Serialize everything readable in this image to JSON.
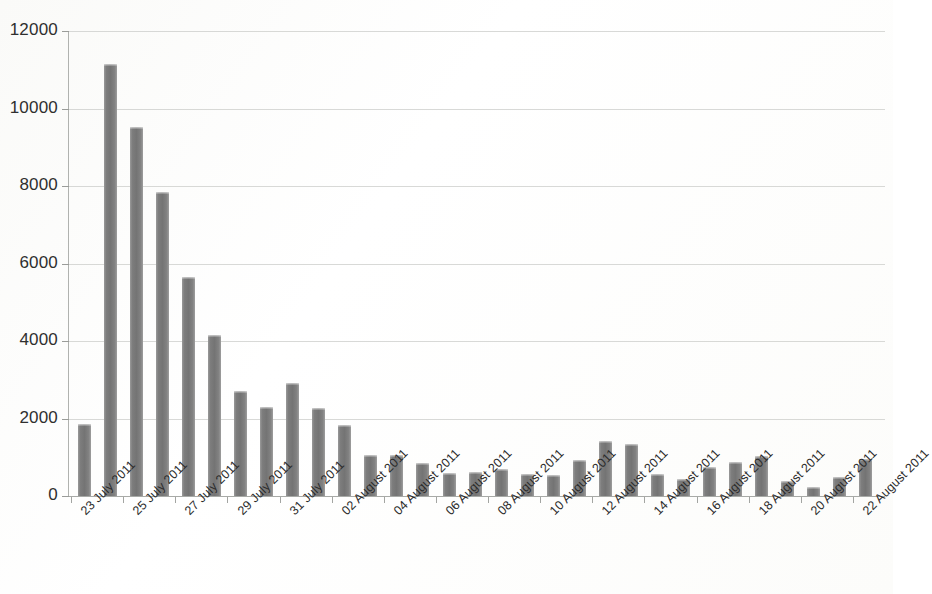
{
  "chart_data": {
    "type": "bar",
    "title": "",
    "xlabel": "",
    "ylabel": "",
    "ylim": [
      0,
      12000
    ],
    "ytick_values": [
      0,
      2000,
      4000,
      6000,
      8000,
      10000,
      12000
    ],
    "ytick_labels": [
      "0",
      "2000",
      "4000",
      "6000",
      "8000",
      "10000",
      "12000"
    ],
    "grid": true,
    "legend": "none",
    "bar_color": "#7d7d7d",
    "categories": [
      "23 July 2011",
      "24 July 2011",
      "25 July 2011",
      "26 July 2011",
      "27 July 2011",
      "28 July 2011",
      "29 July 2011",
      "30 July 2011",
      "31 July 2011",
      "01 August 2011",
      "02 August 2011",
      "03 August 2011",
      "04 August 2011",
      "05 August 2011",
      "06 August 2011",
      "07 August 2011",
      "08 August 2011",
      "09 August 2011",
      "10 August 2011",
      "11 August 2011",
      "12 August 2011",
      "13 August 2011",
      "14 August 2011",
      "15 August 2011",
      "16 August 2011",
      "17 August 2011",
      "18 August 2011",
      "19 August 2011",
      "20 August 2011",
      "21 August 2011",
      "22 August 2011"
    ],
    "values": [
      1850,
      11150,
      9530,
      7840,
      5650,
      4150,
      2700,
      2300,
      2920,
      2270,
      1840,
      1060,
      1060,
      860,
      600,
      620,
      710,
      560,
      540,
      930,
      1430,
      1330,
      560,
      450,
      760,
      880,
      1030,
      380,
      230,
      500,
      960
    ],
    "visible_xtick_labels": [
      "23 July 2011",
      "25 July 2011",
      "27 July 2011",
      "29 July 2011",
      "31 July 2011",
      "02 August 2011",
      "04 August 2011",
      "06 August 2011",
      "08 August 2011",
      "10 August 2011",
      "12 August 2011",
      "14 August 2011",
      "16 August 2011",
      "18 August 2011",
      "20 August 2011",
      "22 August 2011"
    ],
    "visible_xtick_indices": [
      0,
      2,
      4,
      6,
      8,
      10,
      12,
      14,
      16,
      18,
      20,
      22,
      24,
      26,
      28,
      30
    ]
  }
}
